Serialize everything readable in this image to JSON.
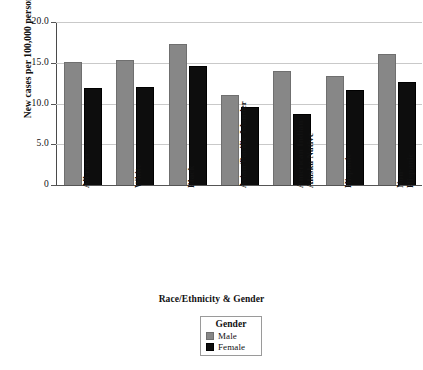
{
  "chart_data": {
    "type": "bar",
    "title": "",
    "subtitle": "",
    "xlabel": "Race/Ethnicity & Gender",
    "ylabel": "New cases per 100,000 persons",
    "categories": [
      "All races",
      "White",
      "Black",
      "Asian/Pacific Islander",
      "American Indian/\nAlaska Native",
      "Hispanic",
      "Non-Hispanic"
    ],
    "series": [
      {
        "name": "Male",
        "color": "#878787",
        "values": [
          15.1,
          15.4,
          17.3,
          11.1,
          14.0,
          13.4,
          16.1
        ]
      },
      {
        "name": "Female",
        "color": "#0d0d0d",
        "values": [
          11.9,
          12.0,
          14.6,
          9.6,
          8.7,
          11.6,
          12.6
        ]
      }
    ],
    "ylim": [
      0,
      20
    ],
    "yticks": [
      0,
      5,
      10,
      15,
      20
    ],
    "ytick_labels": [
      "0",
      "5.0",
      "10.0",
      "15.0",
      "20.0"
    ],
    "grid": "horizontal",
    "legend_position": "bottom-center",
    "legend_title": "Gender"
  },
  "legend": {
    "title": "Gender",
    "entries": [
      {
        "label": "Male"
      },
      {
        "label": "Female"
      }
    ]
  },
  "axes": {
    "y_title": "New cases per 100,000 persons",
    "x_title": "Race/Ethnicity & Gender"
  }
}
